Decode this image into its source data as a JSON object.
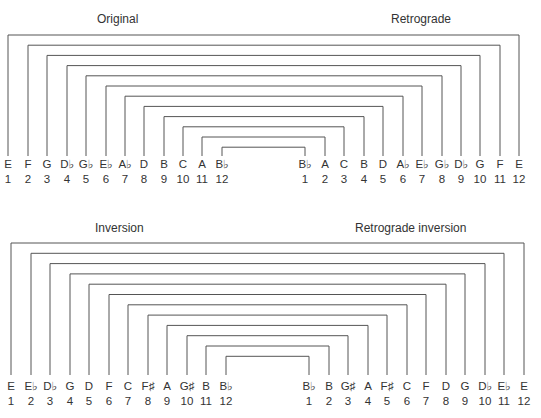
{
  "panels": [
    {
      "id": "top",
      "left_title": "Original",
      "right_title": "Retrograde",
      "left_title_pos": [
        97,
        12
      ],
      "right_title_pos": [
        391,
        12
      ],
      "left_x": [
        8,
        28,
        47,
        67,
        86,
        106,
        125,
        144,
        164,
        183,
        202,
        222
      ],
      "right_x": [
        305,
        325,
        344,
        364,
        383,
        403,
        422,
        442,
        461,
        480,
        500,
        519
      ],
      "bracket_top_y": 35,
      "bracket_step": 10.2,
      "line_bottom_y": 156,
      "label_y": 168,
      "number_y": 183,
      "left_notes": [
        "E",
        "F",
        "G",
        "D♭",
        "G♭",
        "E♭",
        "A♭",
        "D",
        "B",
        "C",
        "A",
        "B♭"
      ],
      "right_notes": [
        "B♭",
        "A",
        "C",
        "B",
        "D",
        "A♭",
        "E♭",
        "G♭",
        "D♭",
        "G",
        "F",
        "E"
      ],
      "numbers": [
        "1",
        "2",
        "3",
        "4",
        "5",
        "6",
        "7",
        "8",
        "9",
        "10",
        "11",
        "12"
      ]
    },
    {
      "id": "bottom",
      "left_title": "Inversion",
      "right_title": "Retrograde inversion",
      "left_title_pos": [
        95,
        221
      ],
      "right_title_pos": [
        355,
        221
      ],
      "left_x": [
        11,
        31,
        50,
        70,
        89,
        109,
        128,
        148,
        167,
        187,
        206,
        226
      ],
      "right_x": [
        309,
        329,
        348,
        368,
        387,
        407,
        426,
        446,
        465,
        485,
        504,
        524
      ],
      "bracket_top_y": 243,
      "bracket_step": 10.3,
      "line_bottom_y": 375,
      "label_y": 390,
      "number_y": 405,
      "left_notes": [
        "E",
        "E♭",
        "D♭",
        "G",
        "D",
        "F",
        "C",
        "F♯",
        "A",
        "G♯",
        "B",
        "B♭"
      ],
      "right_notes": [
        "B♭",
        "B",
        "G♯",
        "A",
        "F♯",
        "C",
        "F",
        "D",
        "G",
        "D♭",
        "E♭",
        "E"
      ],
      "numbers": [
        "1",
        "2",
        "3",
        "4",
        "5",
        "6",
        "7",
        "8",
        "9",
        "10",
        "11",
        "12"
      ]
    }
  ]
}
